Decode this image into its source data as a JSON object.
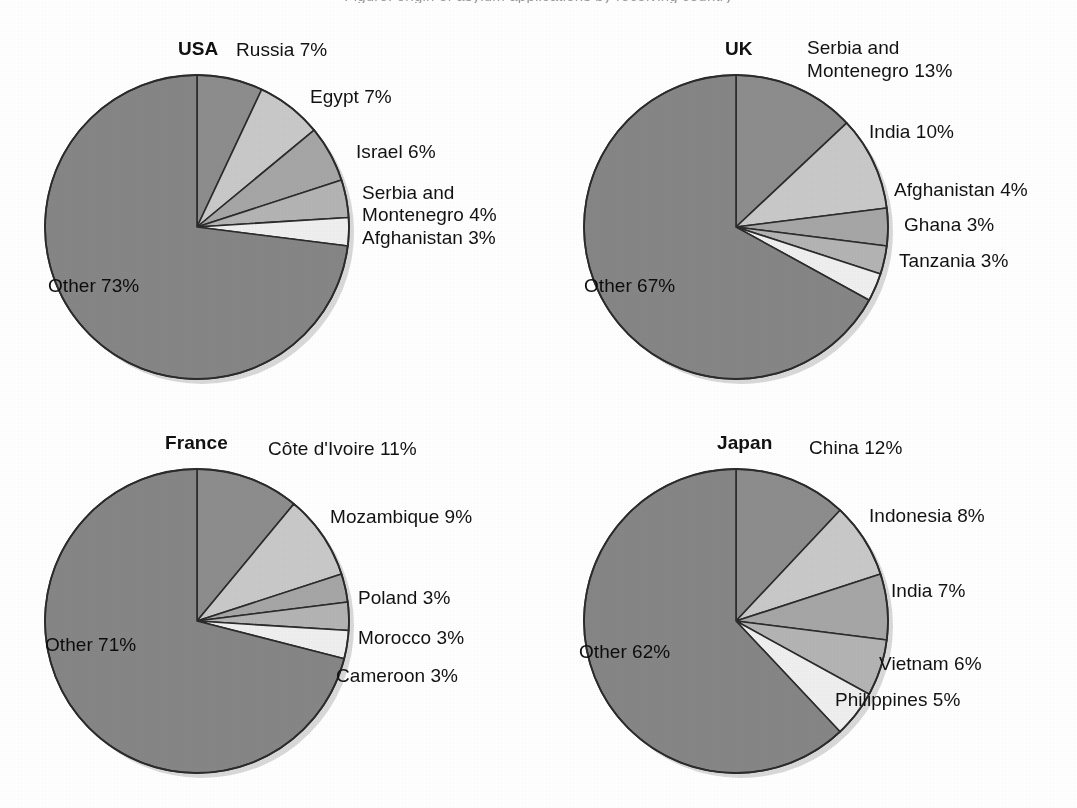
{
  "figure": {
    "clipped_header_text": "Figure: origin of asylum applications by receiving country",
    "background_color": "#ffffff",
    "label_color": "#121212"
  },
  "palette": {
    "other": "#868686",
    "slice_1": "#8d8d8d",
    "slice_2": "#c9c9c9",
    "slice_3": "#a6a6a6",
    "slice_4": "#b4b4b4",
    "slice_5": "#efefef",
    "outline": "#2b2b2b",
    "shadow": "#b9b9b9"
  },
  "chart_data": [
    {
      "type": "pie",
      "title": "USA",
      "unit": "%",
      "categories": [
        "Russia",
        "Egypt",
        "Israel",
        "Serbia and Montenegro",
        "Afghanistan",
        "Other"
      ],
      "values": [
        7,
        7,
        6,
        4,
        3,
        73
      ],
      "labels": [
        "Russia 7%",
        "Egypt 7%",
        "Israel 6%",
        "Serbia and Montenegro 4%",
        "Afghanistan 3%",
        "Other 73%"
      ],
      "inner_label": "Other 73%",
      "start_angle_deg": 0,
      "direction": "clockwise"
    },
    {
      "type": "pie",
      "title": "UK",
      "unit": "%",
      "categories": [
        "Serbia and Montenegro",
        "India",
        "Afghanistan",
        "Ghana",
        "Tanzania",
        "Other"
      ],
      "values": [
        13,
        10,
        4,
        3,
        3,
        67
      ],
      "labels": [
        "Serbia and Montenegro 13%",
        "India 10%",
        "Afghanistan 4%",
        "Ghana 3%",
        "Tanzania 3%",
        "Other 67%"
      ],
      "inner_label": "Other 67%",
      "start_angle_deg": 0,
      "direction": "clockwise"
    },
    {
      "type": "pie",
      "title": "France",
      "unit": "%",
      "categories": [
        "Côte d'Ivoire",
        "Mozambique",
        "Poland",
        "Morocco",
        "Cameroon",
        "Other"
      ],
      "values": [
        11,
        9,
        3,
        3,
        3,
        71
      ],
      "labels": [
        "Côte d'Ivoire 11%",
        "Mozambique 9%",
        "Poland 3%",
        "Morocco 3%",
        "Cameroon 3%",
        "Other 71%"
      ],
      "inner_label": "Other 71%",
      "start_angle_deg": 0,
      "direction": "clockwise"
    },
    {
      "type": "pie",
      "title": "Japan",
      "unit": "%",
      "categories": [
        "China",
        "Indonesia",
        "India",
        "Vietnam",
        "Philippines",
        "Other"
      ],
      "values": [
        12,
        8,
        7,
        6,
        5,
        62
      ],
      "labels": [
        "China 12%",
        "Indonesia 8%",
        "India 7%",
        "Vietnam 6%",
        "Philippines 5%",
        "Other 62%"
      ],
      "inner_label": "Other 62%",
      "start_angle_deg": 0,
      "direction": "clockwise"
    }
  ],
  "panels": {
    "usa": {
      "title": "USA",
      "inner_label": "Other 73%",
      "labels": {
        "l1": "Russia 7%",
        "l2": "Egypt 7%",
        "l3": "Israel 6%",
        "l4a": "Serbia and",
        "l4b": "Montenegro 4%",
        "l5": "Afghanistan 3%"
      }
    },
    "uk": {
      "title": "UK",
      "inner_label": "Other 67%",
      "labels": {
        "l1a": "Serbia and",
        "l1b": "Montenegro 13%",
        "l2": "India 10%",
        "l3": "Afghanistan 4%",
        "l4": "Ghana 3%",
        "l5": "Tanzania 3%"
      }
    },
    "france": {
      "title": "France",
      "inner_label": "Other 71%",
      "labels": {
        "l1": "Côte d'Ivoire 11%",
        "l2": "Mozambique 9%",
        "l3": "Poland 3%",
        "l4": "Morocco 3%",
        "l5": "Cameroon 3%"
      }
    },
    "japan": {
      "title": "Japan",
      "inner_label": "Other 62%",
      "labels": {
        "l1": "China 12%",
        "l2": "Indonesia 8%",
        "l3": "India 7%",
        "l4": "Vietnam 6%",
        "l5": "Philippines 5%"
      }
    }
  }
}
